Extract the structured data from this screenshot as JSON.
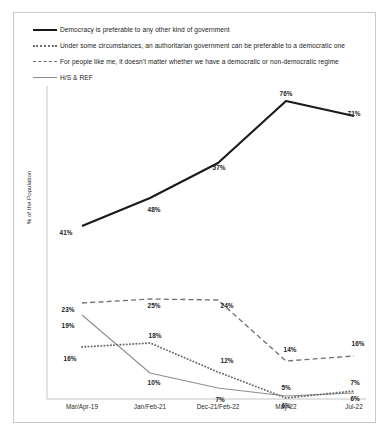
{
  "figure": {
    "ylabel": "% of the Population"
  },
  "legend": [
    {
      "key": "solid-thick",
      "label": "Democracy is preferable to any other kind of government"
    },
    {
      "key": "dotted",
      "label": "Under some circumstances, an authoritarian government can be preferable to a democratic one"
    },
    {
      "key": "dashed",
      "label": "For people like me, it doesn't matter whether we have a democratic or non-democratic regime"
    },
    {
      "key": "solid-thin",
      "label": "H/S & REF"
    }
  ],
  "chart_data": {
    "type": "line",
    "title": "",
    "xlabel": "",
    "ylabel": "% of the Population",
    "ylim": [
      0,
      80
    ],
    "grid": false,
    "legend_position": "top",
    "categories": [
      "Mar/Apr-19",
      "Jan/Feb-21",
      "Dec-21/Feb-22",
      "May-22",
      "Jul-22"
    ],
    "series": [
      {
        "name": "Democracy is preferable to any other kind of government",
        "style": "solid-thick",
        "color": "#1a1a1a",
        "values": [
          41,
          48,
          57,
          76,
          71
        ],
        "labels": [
          "41%",
          "48%",
          "57%",
          "76%",
          "71%"
        ]
      },
      {
        "name": "Under some circumstances, an authoritarian government can be preferable to a democratic one",
        "style": "dotted",
        "color": "#6e6e6e",
        "values": [
          16,
          18,
          12,
          6,
          7
        ],
        "labels": [
          "16%",
          "18%",
          "12%",
          "6%",
          "7%"
        ]
      },
      {
        "name": "For people like me, it doesn't matter whether we have a democratic or non-democratic regime",
        "style": "dashed",
        "color": "#6e6e6e",
        "values": [
          23,
          25,
          24,
          14,
          16
        ],
        "labels": [
          "23%",
          "25%",
          "24%",
          "14%",
          "16%"
        ]
      },
      {
        "name": "H/S & REF",
        "style": "solid-thin",
        "color": "#8d8d8d",
        "values": [
          19,
          10,
          7,
          5,
          6
        ],
        "labels": [
          "19%",
          "10%",
          "7%",
          "5%",
          "6%"
        ]
      }
    ]
  },
  "data_labels": [
    {
      "text": "41%",
      "x": 52,
      "y": 219
    },
    {
      "text": "48%",
      "x": 140,
      "y": 196
    },
    {
      "text": "57%",
      "x": 205,
      "y": 154
    },
    {
      "text": "76%",
      "x": 272,
      "y": 80
    },
    {
      "text": "71%",
      "x": 340,
      "y": 100
    },
    {
      "text": "23%",
      "x": 54,
      "y": 296
    },
    {
      "text": "25%",
      "x": 140,
      "y": 292
    },
    {
      "text": "24%",
      "x": 213,
      "y": 292
    },
    {
      "text": "14%",
      "x": 276,
      "y": 336
    },
    {
      "text": "16%",
      "x": 344,
      "y": 330
    },
    {
      "text": "19%",
      "x": 54,
      "y": 312
    },
    {
      "text": "10%",
      "x": 140,
      "y": 369
    },
    {
      "text": "7%",
      "x": 206,
      "y": 386
    },
    {
      "text": "5%",
      "x": 272,
      "y": 374
    },
    {
      "text": "6%",
      "x": 341,
      "y": 385
    },
    {
      "text": "16%",
      "x": 56,
      "y": 345
    },
    {
      "text": "18%",
      "x": 141,
      "y": 322
    },
    {
      "text": "12%",
      "x": 213,
      "y": 347
    },
    {
      "text": "6%",
      "x": 272,
      "y": 392
    },
    {
      "text": "7%",
      "x": 341,
      "y": 369
    }
  ]
}
